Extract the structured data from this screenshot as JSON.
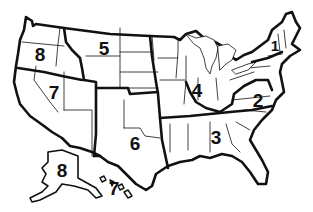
{
  "map": {
    "title": "",
    "type": "US regional map",
    "colors": {
      "stroke": "#111111",
      "fill": "#ffffff",
      "background": "#ffffff"
    },
    "regions": [
      {
        "id": "1",
        "label": "1",
        "area": "New England"
      },
      {
        "id": "2",
        "label": "2",
        "area": "Mid-Atlantic / Virginia-Carolinas"
      },
      {
        "id": "3",
        "label": "3",
        "area": "Southeast"
      },
      {
        "id": "4",
        "label": "4",
        "area": "Great Lakes / Midwest"
      },
      {
        "id": "5",
        "label": "5",
        "area": "Northern Plains / Mountain"
      },
      {
        "id": "6",
        "label": "6",
        "area": "South Central"
      },
      {
        "id": "7",
        "label": "7",
        "area": "Southwest (incl. Hawaii)"
      },
      {
        "id": "7-hi",
        "label": "7",
        "area": "Hawaii inset"
      },
      {
        "id": "8",
        "label": "8",
        "area": "Pacific Northwest"
      },
      {
        "id": "8-ak",
        "label": "8",
        "area": "Alaska inset"
      }
    ]
  }
}
